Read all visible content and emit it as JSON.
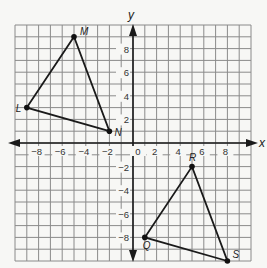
{
  "diagram": {
    "type": "coordinate-plane",
    "x_axis_label": "x",
    "y_axis_label": "y",
    "range": {
      "xmin": -10,
      "xmax": 10,
      "ymin": -10,
      "ymax": 10
    },
    "grid_step": 1,
    "x_tick_labels": [
      {
        "value": -8,
        "text": "−8"
      },
      {
        "value": -6,
        "text": "−6"
      },
      {
        "value": -4,
        "text": "−4"
      },
      {
        "value": -2,
        "text": "−2"
      },
      {
        "value": 0,
        "text": "0"
      },
      {
        "value": 2,
        "text": "2"
      },
      {
        "value": 4,
        "text": "4"
      },
      {
        "value": 6,
        "text": "6"
      },
      {
        "value": 8,
        "text": "8"
      }
    ],
    "y_tick_labels": [
      {
        "value": 8,
        "text": "8"
      },
      {
        "value": 6,
        "text": "6"
      },
      {
        "value": 4,
        "text": "4"
      },
      {
        "value": 2,
        "text": "2"
      },
      {
        "value": -2,
        "text": "−2"
      },
      {
        "value": -4,
        "text": "−4"
      },
      {
        "value": -6,
        "text": "−6"
      },
      {
        "value": -8,
        "text": "−8"
      }
    ],
    "triangles": [
      {
        "name": "LMN",
        "vertices": [
          {
            "label": "L",
            "x": -9,
            "y": 3
          },
          {
            "label": "M",
            "x": -5,
            "y": 9
          },
          {
            "label": "N",
            "x": -2,
            "y": 1
          }
        ]
      },
      {
        "name": "QRS",
        "vertices": [
          {
            "label": "Q",
            "x": 1,
            "y": -8
          },
          {
            "label": "R",
            "x": 5,
            "y": -2
          },
          {
            "label": "S",
            "x": 8,
            "y": -10
          }
        ]
      }
    ],
    "colors": {
      "grid": "#8a8a8a",
      "axis": "#1a1a1a",
      "figure": "#1a1a1a",
      "background": "#f7f7f5"
    }
  }
}
